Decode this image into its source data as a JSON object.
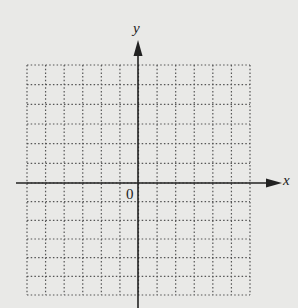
{
  "diagram": {
    "type": "coordinate-grid",
    "x_axis_label": "x",
    "y_axis_label": "y",
    "origin_label": "0",
    "grid": {
      "columns": 12,
      "rows": 12,
      "columns_left_of_y_axis": 6,
      "rows_above_x_axis": 6,
      "line_style": "dotted"
    },
    "colors": {
      "background": "#e9e9e7",
      "axis": "#222222",
      "grid": "#555555"
    }
  }
}
